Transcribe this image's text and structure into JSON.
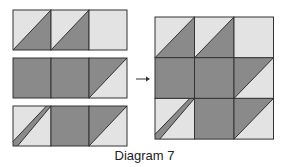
{
  "caption": "Diagram 7",
  "colors": {
    "light": "#e3e3e3",
    "dark": "#8a8a8a",
    "outline": "#333333"
  },
  "strips": [
    [
      "hst-light-tl-dark-br",
      "hst-light-tl-dark-br",
      "light"
    ],
    [
      "dark",
      "dark",
      "hst-dark-tl-light-br"
    ],
    [
      "stem",
      "dark",
      "hst-dark-tl-light-br"
    ]
  ],
  "assembled_block": [
    [
      "hst-light-tl-dark-br",
      "hst-light-tl-dark-br",
      "light"
    ],
    [
      "dark",
      "dark",
      "hst-dark-tl-light-br"
    ],
    [
      "stem",
      "dark",
      "hst-dark-tl-light-br"
    ]
  ],
  "arrow": "→"
}
